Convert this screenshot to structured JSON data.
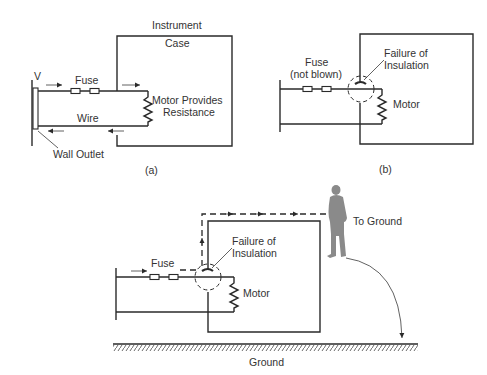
{
  "diagram_a": {
    "caption": "(a)",
    "labels": {
      "voltage": "V",
      "fuse": "Fuse",
      "wire": "Wire",
      "wall_outlet": "Wall Outlet",
      "case_line1": "Instrument",
      "case_line2": "Case",
      "motor_line1": "Motor Provides",
      "motor_line2": "Resistance"
    }
  },
  "diagram_b": {
    "caption": "(b)",
    "labels": {
      "fuse_line1": "Fuse",
      "fuse_line2": "(not blown)",
      "failure_line1": "Failure of",
      "failure_line2": "Insulation",
      "motor": "Motor"
    }
  },
  "diagram_c": {
    "labels": {
      "fuse": "Fuse",
      "failure_line1": "Failure of",
      "failure_line2": "Insulation",
      "motor": "Motor",
      "to_ground": "To Ground",
      "ground": "Ground"
    }
  },
  "colors": {
    "line": "#2a2a2a",
    "text": "#333333",
    "person": "#8a8a8a"
  }
}
